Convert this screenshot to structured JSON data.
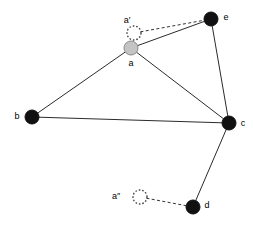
{
  "figure": {
    "width": 253,
    "height": 226,
    "background_color": "#ffffff",
    "type": "node-link-diagram"
  },
  "chart_data": {
    "type": "diagram",
    "title": "",
    "xlabel": "",
    "ylabel": "",
    "nodes": [
      {
        "id": "a",
        "label": "a",
        "x": 131,
        "y": 48,
        "r": 7,
        "style": "filled-gray",
        "color": "#c4c4c4",
        "label_dx": 0,
        "label_dy": 16,
        "label_anchor": "middle"
      },
      {
        "id": "ap",
        "label": "a′",
        "x": 134,
        "y": 33,
        "r": 7,
        "style": "ghost-dotted",
        "color": "#ffffff",
        "label_dx": -7,
        "label_dy": -12,
        "label_anchor": "middle"
      },
      {
        "id": "app",
        "label": "a″",
        "x": 140,
        "y": 197,
        "r": 7,
        "style": "ghost-dotted",
        "color": "#ffffff",
        "label_dx": -24,
        "label_dy": 0,
        "label_anchor": "middle"
      },
      {
        "id": "b",
        "label": "b",
        "x": 32,
        "y": 117,
        "r": 7,
        "style": "filled-dark",
        "color": "#111111",
        "label_dx": -15,
        "label_dy": 0,
        "label_anchor": "middle"
      },
      {
        "id": "c",
        "label": "c",
        "x": 229,
        "y": 123,
        "r": 7,
        "style": "filled-dark",
        "color": "#111111",
        "label_dx": 14,
        "label_dy": 1,
        "label_anchor": "middle"
      },
      {
        "id": "d",
        "label": "d",
        "x": 193,
        "y": 207,
        "r": 7,
        "style": "filled-dark",
        "color": "#111111",
        "label_dx": 14,
        "label_dy": -1,
        "label_anchor": "middle"
      },
      {
        "id": "e",
        "label": "e",
        "x": 211,
        "y": 19,
        "r": 7,
        "style": "filled-dark",
        "color": "#111111",
        "label_dx": 15,
        "label_dy": -1,
        "label_anchor": "middle"
      }
    ],
    "edges": [
      {
        "id": "a-b",
        "source": "a",
        "target": "b",
        "style": "solid",
        "color": "#2b2b2b"
      },
      {
        "id": "a-c",
        "source": "a",
        "target": "c",
        "style": "solid",
        "color": "#2b2b2b"
      },
      {
        "id": "a-e",
        "source": "a",
        "target": "e",
        "style": "solid",
        "color": "#2b2b2b"
      },
      {
        "id": "b-c",
        "source": "b",
        "target": "c",
        "style": "solid",
        "color": "#2b2b2b"
      },
      {
        "id": "c-e",
        "source": "c",
        "target": "e",
        "style": "solid",
        "color": "#2b2b2b"
      },
      {
        "id": "c-d",
        "source": "c",
        "target": "d",
        "style": "solid",
        "color": "#2b2b2b"
      },
      {
        "id": "ap-e",
        "source": "ap",
        "target": "e",
        "style": "dashed",
        "color": "#333333"
      },
      {
        "id": "app-d",
        "source": "app",
        "target": "d",
        "style": "dashed",
        "color": "#333333"
      }
    ]
  }
}
